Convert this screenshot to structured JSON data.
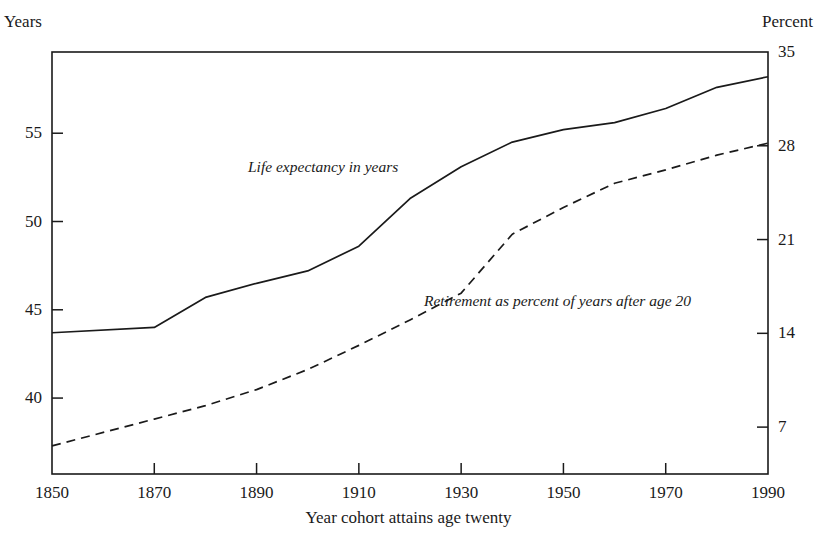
{
  "chart_data": {
    "type": "line",
    "title": "",
    "xlabel": "Year cohort attains age twenty",
    "ylabel_left": "Years",
    "ylabel_right": "Percent",
    "grid": false,
    "legend_position": "inline-annotation",
    "xlim": [
      1850,
      1990
    ],
    "xticks": [
      1850,
      1870,
      1890,
      1910,
      1930,
      1950,
      1970,
      1990
    ],
    "xticklabels": [
      "1850",
      "1870",
      "1890",
      "1910",
      "1930",
      "1950",
      "1970",
      "1990"
    ],
    "ylim_left": [
      35.7,
      59.6
    ],
    "yticks_left": [
      40,
      45,
      50,
      55
    ],
    "yticklabels_left": [
      "40",
      "45",
      "50",
      "55"
    ],
    "ylim_right": [
      3.5,
      35
    ],
    "yticks_right": [
      7,
      14,
      21,
      28,
      35
    ],
    "yticklabels_right": [
      "7",
      "14",
      "21",
      "28",
      "35"
    ],
    "series": [
      {
        "name": "Life expectancy in years",
        "axis": "left",
        "style": "solid",
        "label": "Life expectancy in years",
        "x": [
          1850,
          1870,
          1880,
          1890,
          1900,
          1910,
          1920,
          1930,
          1940,
          1950,
          1960,
          1970,
          1980,
          1990
        ],
        "values": [
          43.7,
          44.0,
          45.7,
          46.5,
          47.2,
          48.6,
          51.3,
          53.1,
          54.5,
          55.2,
          55.6,
          56.4,
          57.6,
          58.2
        ]
      },
      {
        "name": "Retirement as percent of years after age 20",
        "axis": "right",
        "style": "dashed",
        "label": "Retirement as percent of years after age 20",
        "x": [
          1850,
          1870,
          1880,
          1890,
          1900,
          1910,
          1920,
          1930,
          1940,
          1950,
          1960,
          1970,
          1980,
          1990
        ],
        "values": [
          5.6,
          7.6,
          8.6,
          9.8,
          11.3,
          13.1,
          15.0,
          17.0,
          21.4,
          23.4,
          25.2,
          26.2,
          27.3,
          28.2
        ]
      }
    ]
  }
}
